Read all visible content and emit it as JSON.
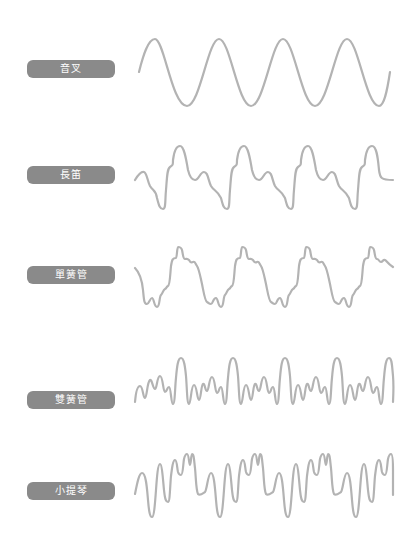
{
  "figure": {
    "title": "",
    "wave_color": "#b3b3b3",
    "label_bg_color": "#8a8a8a",
    "label_text_color": "#ffffff"
  },
  "instruments": [
    {
      "label": "音叉",
      "english": "tuning fork",
      "label_top": 60,
      "wave": "sine"
    },
    {
      "label": "長笛",
      "english": "flute",
      "label_top": 166,
      "wave": "flute"
    },
    {
      "label": "單簧管",
      "english": "clarinet",
      "label_top": 266,
      "wave": "clarinet"
    },
    {
      "label": "雙簧管",
      "english": "oboe",
      "label_top": 391,
      "wave": "oboe"
    },
    {
      "label": "小提琴",
      "english": "violin",
      "label_top": 482,
      "wave": "violin"
    }
  ]
}
